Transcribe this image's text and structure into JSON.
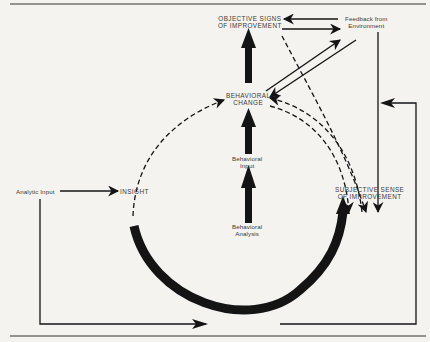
{
  "diagram": {
    "colors": {
      "ink": "#141414",
      "paper": "#f4f3f0",
      "text": "#3a3a3a"
    },
    "nodes": {
      "objective_signs": "OBJECTIVE SIGNS\nOF IMPROVEMENT",
      "feedback": "Feedback from\nEnvironment",
      "behavioral_change": "BEHAVIORAL\nCHANGE",
      "behavioral_input": "Behavioral\nInput",
      "behavioral_analysis": "Behavioral\nAnalysis",
      "subjective_sense": "SUBJECTIVE SENSE\nOF IMPROVEMENT",
      "analytic_input": "Analytic Input",
      "insight": "INSIGHT"
    },
    "edges": [
      {
        "from": "Analytic Input",
        "to": "INSIGHT",
        "style": "solid"
      },
      {
        "from": "INSIGHT",
        "to": "BEHAVIORAL CHANGE",
        "style": "dashed"
      },
      {
        "from": "INSIGHT",
        "to": "SUBJECTIVE SENSE OF IMPROVEMENT",
        "style": "thick-arc"
      },
      {
        "from": "Behavioral Analysis",
        "to": "Behavioral Input",
        "style": "thick"
      },
      {
        "from": "Behavioral Input",
        "to": "BEHAVIORAL CHANGE",
        "style": "thick"
      },
      {
        "from": "BEHAVIORAL CHANGE",
        "to": "OBJECTIVE SIGNS OF IMPROVEMENT",
        "style": "thick"
      },
      {
        "from": "Feedback from Environment",
        "to": "OBJECTIVE SIGNS OF IMPROVEMENT",
        "style": "solid"
      },
      {
        "from": "OBJECTIVE SIGNS OF IMPROVEMENT",
        "to": "Feedback from Environment",
        "style": "solid"
      },
      {
        "from": "BEHAVIORAL CHANGE",
        "to": "Feedback from Environment",
        "style": "solid"
      },
      {
        "from": "Feedback from Environment",
        "to": "BEHAVIORAL CHANGE",
        "style": "solid"
      },
      {
        "from": "Feedback from Environment",
        "to": "SUBJECTIVE SENSE OF IMPROVEMENT",
        "style": "solid"
      },
      {
        "from": "OBJECTIVE SIGNS OF IMPROVEMENT",
        "to": "SUBJECTIVE SENSE OF IMPROVEMENT",
        "style": "dashed"
      },
      {
        "from": "BEHAVIORAL CHANGE",
        "to": "SUBJECTIVE SENSE OF IMPROVEMENT",
        "style": "dashed"
      },
      {
        "from": "SUBJECTIVE SENSE OF IMPROVEMENT",
        "to": "BEHAVIORAL CHANGE",
        "style": "dashed"
      },
      {
        "from": "Analytic Input",
        "to": "bottom loop",
        "style": "solid"
      },
      {
        "from": "bottom loop",
        "to": "Feedback channel",
        "style": "solid"
      }
    ]
  }
}
